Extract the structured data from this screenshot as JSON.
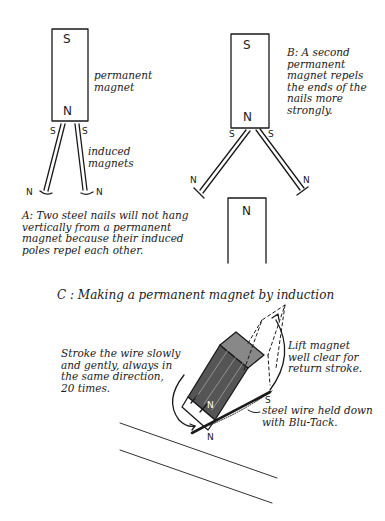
{
  "diagram": {
    "panel_a": {
      "magnet_top_pole": "S",
      "magnet_bottom_pole": "N",
      "magnet_label": "permanent\nmagnet",
      "nail_top_left_pole": "S",
      "nail_top_right_pole": "S",
      "nail_bottom_left_pole": "N",
      "nail_bottom_right_pole": "N",
      "nails_label": "induced\nmagnets",
      "caption": "A: Two steel nails will not hang\n     vertically from a permanent\n     magnet because their induced\n     poles repel each other."
    },
    "panel_b": {
      "magnet_top_pole": "S",
      "magnet_bottom_pole": "N",
      "nail_top_left_pole": "S",
      "nail_top_right_pole": "S",
      "nail_bottom_left_pole": "N",
      "nail_bottom_right_pole": "N",
      "second_magnet_pole": "N",
      "caption": "B: A second\n    permanent\n    magnet repels\n    the ends of the\n    nails more\n    strongly."
    },
    "panel_c": {
      "title": "C : Making a permanent magnet by induction",
      "instruction": "Stroke the wire slowly\nand gently, always in\nthe same direction,\n20 times.",
      "lift_note": "Lift magnet\nwell clear for\nreturn stroke.",
      "wire_note": "steel wire held down\nwith Blu-Tack.",
      "magnet_face_pole": "N",
      "wire_start_pole": "N",
      "wire_end_pole": "S"
    }
  }
}
